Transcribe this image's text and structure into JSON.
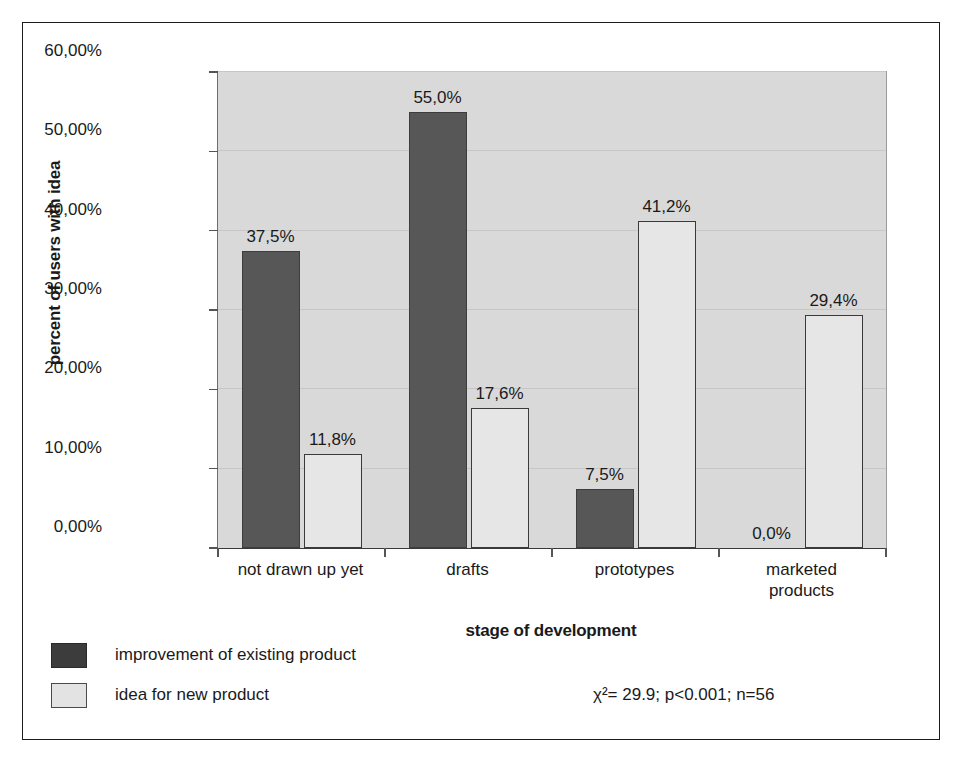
{
  "chart_data": {
    "type": "bar",
    "title": "",
    "xlabel": "stage of development",
    "ylabel": "percent of users with idea",
    "categories": [
      "not drawn up yet",
      "drafts",
      "prototypes",
      "marketed\nproducts"
    ],
    "series": [
      {
        "name": "improvement of existing product",
        "values": [
          37.5,
          55.0,
          7.5,
          0.0
        ],
        "labels": [
          "37,5%",
          "55,0%",
          "7,5%",
          "0,0%"
        ],
        "color": "#575757"
      },
      {
        "name": "idea for new product",
        "values": [
          11.8,
          17.6,
          41.2,
          29.4
        ],
        "labels": [
          "11,8%",
          "17,6%",
          "41,2%",
          "29,4%"
        ],
        "color": "#e6e6e6"
      }
    ],
    "ylim": [
      0,
      60
    ],
    "ytick_values": [
      0,
      10,
      20,
      30,
      40,
      50,
      60
    ],
    "ytick_labels": [
      "0,00%",
      "10,00%",
      "20,00%",
      "30,00%",
      "40,00%",
      "50,00%",
      "60,00%"
    ],
    "grid": true,
    "legend_position": "bottom-left",
    "plot_background": "#d9d9d9",
    "annotations": [
      "χ²= 29.9; p<0.001; n=56"
    ]
  },
  "annotation": {
    "stats": "χ²= 29.9; p<0.001; n=56"
  },
  "legend": {
    "items": [
      {
        "label": "improvement of existing product"
      },
      {
        "label": "idea for new product"
      }
    ]
  }
}
